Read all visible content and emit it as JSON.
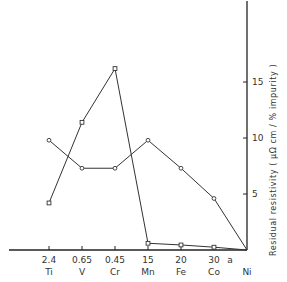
{
  "chart_data": {
    "type": "line",
    "title": "",
    "xlabel": "",
    "ylabel": "Residual resistivity ( μΩ cm / % impurity )",
    "ylim": [
      0,
      20
    ],
    "yticks": [
      5,
      10,
      15
    ],
    "y_axis_position": "right",
    "grid": false,
    "legend": null,
    "categories": [
      "Ti",
      "V",
      "Cr",
      "Mn",
      "Fe",
      "Co",
      "Ni"
    ],
    "category_values": [
      "2.4",
      "0.65",
      "0.45",
      "15",
      "20",
      "30",
      "a"
    ],
    "annotation_after_co": "a",
    "series": [
      {
        "name": "circle-markers",
        "marker": "circle",
        "values": [
          9.8,
          7.3,
          7.3,
          9.8,
          7.3,
          4.6,
          0
        ]
      },
      {
        "name": "square-markers",
        "marker": "square",
        "values": [
          4.2,
          11.4,
          16.2,
          0.6,
          0.45,
          0.25,
          0
        ]
      }
    ]
  },
  "axis": {
    "x_tick_values": [
      "2.4",
      "0.65",
      "0.45",
      "15",
      "20",
      "30"
    ],
    "x_tick_elements": [
      "Ti",
      "V",
      "Cr",
      "Mn",
      "Fe",
      "Co",
      "Ni"
    ],
    "extra_label": "a",
    "y_tick_labels": [
      "5",
      "10",
      "15"
    ]
  }
}
